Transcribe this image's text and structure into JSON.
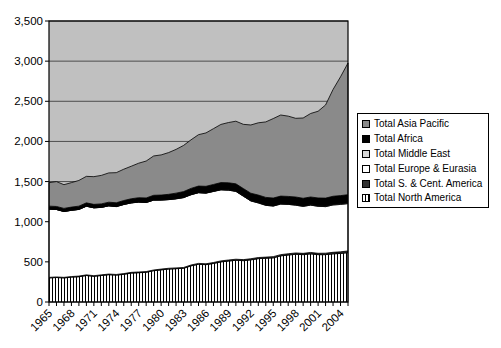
{
  "figure": {
    "background": "#ffffff"
  },
  "chart_data": {
    "type": "area",
    "stacked": true,
    "title": "",
    "xlabel": "",
    "ylabel": "",
    "ylim": [
      0,
      3500
    ],
    "grid": true,
    "plot_background": "#c0c0c0",
    "gridline_color": "#4d4d4d",
    "axis_color": "#000000",
    "yticks": [
      {
        "value": 0,
        "label": "0"
      },
      {
        "value": 500,
        "label": "500"
      },
      {
        "value": 1000,
        "label": "1,000"
      },
      {
        "value": 1500,
        "label": "1,500"
      },
      {
        "value": 2000,
        "label": "2,000"
      },
      {
        "value": 2500,
        "label": "2,500"
      },
      {
        "value": 3000,
        "label": "3,000"
      },
      {
        "value": 3500,
        "label": "3,500"
      }
    ],
    "x": [
      1965,
      1966,
      1967,
      1968,
      1969,
      1970,
      1971,
      1972,
      1973,
      1974,
      1975,
      1976,
      1977,
      1978,
      1979,
      1980,
      1981,
      1982,
      1983,
      1984,
      1985,
      1986,
      1987,
      1988,
      1989,
      1990,
      1991,
      1992,
      1993,
      1994,
      1995,
      1996,
      1997,
      1998,
      1999,
      2000,
      2001,
      2002,
      2003,
      2004,
      2005
    ],
    "xtick_labels": [
      "1965",
      "1968",
      "1971",
      "1974",
      "1977",
      "1980",
      "1983",
      "1986",
      "1989",
      "1992",
      "1995",
      "1998",
      "2001",
      "2004"
    ],
    "series": [
      {
        "name": "Total North America",
        "color": "#ffffff",
        "pattern": "hatch-vertical",
        "values": [
          300,
          305,
          300,
          310,
          315,
          330,
          320,
          330,
          340,
          335,
          345,
          360,
          365,
          370,
          390,
          400,
          410,
          415,
          420,
          450,
          470,
          465,
          480,
          500,
          510,
          520,
          515,
          525,
          540,
          545,
          550,
          575,
          585,
          595,
          590,
          600,
          590,
          590,
          600,
          605,
          615
        ]
      },
      {
        "name": "Total S. & Cent. America",
        "color": "#333333",
        "pattern": "solid",
        "values": [
          7,
          7,
          7,
          7,
          8,
          8,
          8,
          8,
          8,
          8,
          9,
          9,
          9,
          9,
          9,
          10,
          10,
          10,
          10,
          11,
          11,
          11,
          12,
          12,
          13,
          13,
          13,
          14,
          14,
          14,
          15,
          15,
          16,
          16,
          16,
          17,
          17,
          18,
          19,
          20,
          21
        ]
      },
      {
        "name": "Total Europe & Eurasia",
        "color": "#ffffff",
        "pattern": "solid",
        "values": [
          850,
          840,
          820,
          825,
          830,
          855,
          845,
          840,
          850,
          845,
          860,
          865,
          870,
          860,
          870,
          860,
          855,
          860,
          870,
          875,
          880,
          880,
          885,
          885,
          870,
          845,
          790,
          720,
          680,
          645,
          630,
          630,
          615,
          595,
          585,
          590,
          585,
          580,
          590,
          590,
          590
        ]
      },
      {
        "name": "Total Middle East",
        "color": "#d9d9d9",
        "pattern": "solid",
        "values": [
          1,
          1,
          1,
          1,
          1,
          1,
          1,
          1,
          1,
          2,
          2,
          2,
          2,
          2,
          2,
          2,
          2,
          3,
          3,
          3,
          3,
          3,
          3,
          4,
          4,
          4,
          4,
          4,
          5,
          5,
          5,
          5,
          5,
          6,
          6,
          6,
          7,
          7,
          8,
          9,
          9
        ]
      },
      {
        "name": "Total Africa",
        "color": "#000000",
        "pattern": "solid",
        "values": [
          36,
          37,
          38,
          39,
          40,
          41,
          42,
          43,
          44,
          46,
          48,
          50,
          53,
          55,
          58,
          60,
          64,
          68,
          72,
          76,
          80,
          82,
          84,
          86,
          88,
          90,
          91,
          92,
          93,
          94,
          95,
          94,
          94,
          96,
          95,
          95,
          97,
          99,
          100,
          101,
          102
        ]
      },
      {
        "name": "Total Asia Pacific",
        "color": "#8a8a8a",
        "pattern": "solid",
        "values": [
          292,
          310,
          295,
          305,
          320,
          330,
          345,
          355,
          365,
          375,
          390,
          405,
          430,
          460,
          490,
          500,
          520,
          545,
          575,
          605,
          640,
          665,
          695,
          725,
          750,
          780,
          800,
          850,
          900,
          940,
          990,
          1010,
          1000,
          980,
          1000,
          1040,
          1080,
          1160,
          1330,
          1480,
          1640
        ]
      }
    ],
    "legend": {
      "position": "right",
      "entries": [
        {
          "label": "Total Asia Pacific",
          "marker": "#8a8a8a"
        },
        {
          "label": "Total Africa",
          "marker": "#000000"
        },
        {
          "label": "Total Middle East",
          "marker": "#d9d9d9"
        },
        {
          "label": "Total Europe & Eurasia",
          "marker": "#ffffff"
        },
        {
          "label": "Total S. & Cent. America",
          "marker": "#333333"
        },
        {
          "label": "Total North America",
          "marker": "hatch-vertical"
        }
      ]
    }
  }
}
